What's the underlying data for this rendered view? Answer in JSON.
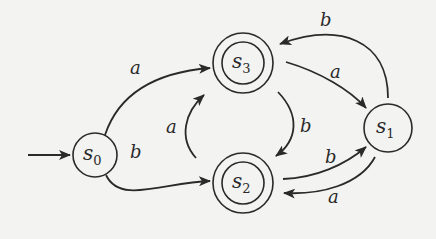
{
  "diagram": {
    "type": "finite-automaton",
    "start_state": "s0",
    "states": [
      {
        "id": "s0",
        "label": "s",
        "sub": "0",
        "accepting": false
      },
      {
        "id": "s1",
        "label": "s",
        "sub": "1",
        "accepting": false
      },
      {
        "id": "s2",
        "label": "s",
        "sub": "2",
        "accepting": true
      },
      {
        "id": "s3",
        "label": "s",
        "sub": "3",
        "accepting": true
      }
    ],
    "transitions": [
      {
        "from": "s0",
        "to": "s3",
        "label": "a"
      },
      {
        "from": "s0",
        "to": "s2",
        "label": "b"
      },
      {
        "from": "s3",
        "to": "s1",
        "label": "a"
      },
      {
        "from": "s3",
        "to": "s2",
        "label": "b"
      },
      {
        "from": "s2",
        "to": "s3",
        "label": "a"
      },
      {
        "from": "s2",
        "to": "s1",
        "label": "b"
      },
      {
        "from": "s1",
        "to": "s3",
        "label": "b"
      },
      {
        "from": "s1",
        "to": "s2",
        "label": "a"
      }
    ]
  }
}
